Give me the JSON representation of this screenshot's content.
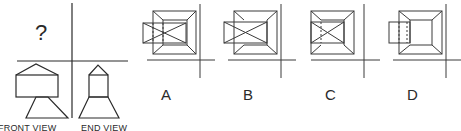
{
  "question": {
    "unknown_view_mark": "?",
    "captions": {
      "front": "FRONT VIEW",
      "end": "END VIEW"
    }
  },
  "options": [
    {
      "label": "A",
      "description": "square hip roof plan with overlaid horizontal rectangle (X-crossed) extending left, dotted hidden lines"
    },
    {
      "label": "B",
      "description": "square hip roof plan with overlaid horizontal rectangle (X-crossed) extending left, no hidden lines"
    },
    {
      "label": "C",
      "description": "square hip roof plan with inner X-crossed rectangle contained within square, dotted hidden line"
    },
    {
      "label": "D",
      "description": "square hip roof plan with plain rectangle extending left and dotted hidden lines"
    }
  ],
  "colors": {
    "line": "#2a2a2a",
    "background": "#ffffff"
  }
}
